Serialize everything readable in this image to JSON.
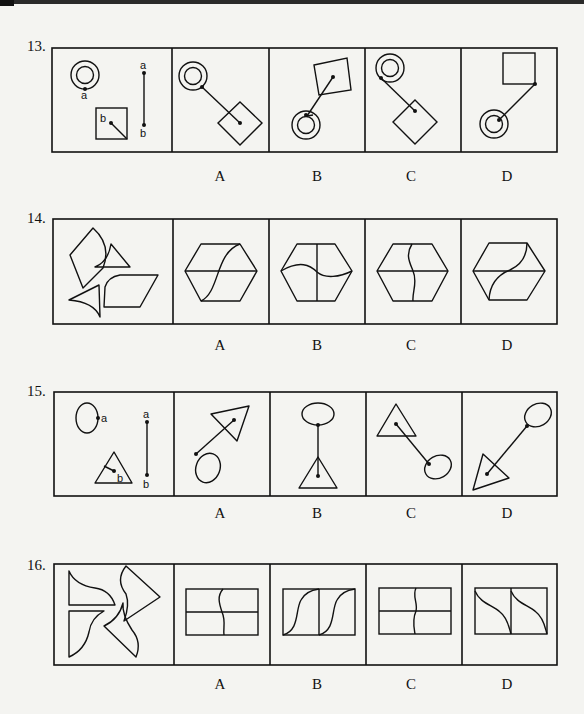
{
  "questions": [
    {
      "number": "13.",
      "stem": {
        "labels": [
          "a",
          "a",
          "b",
          "b"
        ]
      },
      "options": [
        "A",
        "B",
        "C",
        "D"
      ]
    },
    {
      "number": "14.",
      "options": [
        "A",
        "B",
        "C",
        "D"
      ]
    },
    {
      "number": "15.",
      "stem": {
        "labels": [
          "a",
          "a",
          "b",
          "b"
        ]
      },
      "options": [
        "A",
        "B",
        "C",
        "D"
      ]
    },
    {
      "number": "16.",
      "options": [
        "A",
        "B",
        "C",
        "D"
      ]
    }
  ],
  "colors": {
    "ink": "#111111",
    "paper": "#f4f4f1"
  }
}
